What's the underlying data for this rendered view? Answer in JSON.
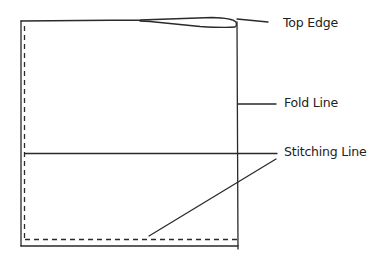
{
  "diagram": {
    "type": "sewing pattern / fold diagram",
    "stroke_color": "#2a2a2a",
    "background": "#ffffff",
    "labels": [
      {
        "id": "top-edge",
        "text": "Top Edge",
        "x": 283,
        "y": 17
      },
      {
        "id": "fold-line",
        "text": "Fold Line",
        "x": 284,
        "y": 97
      },
      {
        "id": "stitching-line",
        "text": "Stitching Line",
        "x": 284,
        "y": 146
      }
    ],
    "shapes": {
      "outer_rect": {
        "left": 21,
        "top": 21,
        "right": 237,
        "bottom": 245
      },
      "stitch_dashed": {
        "x": 24,
        "top": 26,
        "bottom": 239,
        "right": 237
      },
      "horizontal_line_y": 153,
      "leaders": [
        {
          "for": "top-edge",
          "x1": 237,
          "y1": 19,
          "x2": 268,
          "y2": 22
        },
        {
          "for": "fold-line",
          "x1": 237,
          "y1": 104,
          "x2": 276,
          "y2": 104
        },
        {
          "for": "stitching-line",
          "x1": 25,
          "y1": 153,
          "x2": 277,
          "y2": 153
        },
        {
          "for": "stitching-line",
          "x1": 149,
          "y1": 236,
          "x2": 276,
          "y2": 159
        }
      ]
    }
  }
}
